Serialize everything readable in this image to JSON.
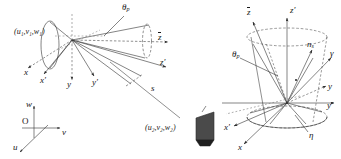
{
  "figure": {
    "background_color": "#ffffff",
    "line_color": "#303030",
    "dash_color": "#606060"
  },
  "left_diagram": {
    "name": "left-cone-diagram",
    "point_label_top": "(u₁,v₁,w₁)",
    "point_label_bottom": "(u₂,v₂,w₂)",
    "angle_label": "θ",
    "angle_sub": "p",
    "distance_label": "s",
    "axes": [
      {
        "name": "axis-x",
        "label": "x",
        "prime": false
      },
      {
        "name": "axis-x-prime",
        "label": "x",
        "prime": true
      },
      {
        "name": "axis-y",
        "label": "y",
        "prime": false
      },
      {
        "name": "axis-y-prime",
        "label": "y",
        "prime": true
      },
      {
        "name": "axis-z-bar",
        "label": "z",
        "prime": false
      },
      {
        "name": "axis-z-prime",
        "label": "z",
        "prime": true
      }
    ],
    "uvw_frame": {
      "origin_label": "O",
      "up_label": "w",
      "right_label": "v",
      "down_label": "u"
    }
  },
  "right_diagram": {
    "name": "right-cone-diagram",
    "angle_label": "θ",
    "angle_sub": "p",
    "normal_label": "n",
    "normal_sub": "s",
    "gamma_label": "γ",
    "eta_label": "η",
    "axes": [
      {
        "name": "axis-z-bar",
        "label": "z",
        "prime": false
      },
      {
        "name": "axis-z-prime",
        "label": "z",
        "prime": true
      },
      {
        "name": "axis-y",
        "label": "y",
        "prime": false
      },
      {
        "name": "axis-y-prime",
        "label": "y",
        "prime": true
      },
      {
        "name": "axis-x",
        "label": "x",
        "prime": false
      },
      {
        "name": "axis-x-prime",
        "label": "x",
        "prime": true
      }
    ]
  }
}
